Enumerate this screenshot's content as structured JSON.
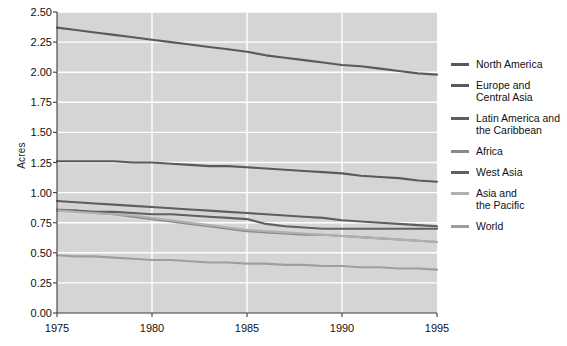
{
  "chart_data": {
    "type": "line",
    "title": "",
    "xlabel": "",
    "ylabel": "Acres",
    "xlim": [
      1975,
      1995
    ],
    "ylim": [
      0.0,
      2.5
    ],
    "grid": true,
    "legend_position": "right",
    "x": [
      1975,
      1976,
      1977,
      1978,
      1979,
      1980,
      1981,
      1982,
      1983,
      1984,
      1985,
      1986,
      1987,
      1988,
      1989,
      1990,
      1991,
      1992,
      1993,
      1994,
      1995
    ],
    "xticks": [
      "1975",
      "1980",
      "1985",
      "1990",
      "1995"
    ],
    "yticks": [
      "0.00",
      "0.25",
      "0.50",
      "0.75",
      "1.00",
      "1.25",
      "1.50",
      "1.75",
      "2.00",
      "2.25",
      "2.50"
    ],
    "series": [
      {
        "name": "North America",
        "color": "#5a5a5a",
        "values": [
          2.37,
          2.35,
          2.33,
          2.31,
          2.29,
          2.27,
          2.25,
          2.23,
          2.21,
          2.19,
          2.17,
          2.14,
          2.12,
          2.1,
          2.08,
          2.06,
          2.05,
          2.03,
          2.01,
          1.99,
          1.98
        ]
      },
      {
        "name": "Europe and\nCentral Asia",
        "color": "#5a5a5a",
        "values": [
          1.26,
          1.26,
          1.26,
          1.26,
          1.25,
          1.25,
          1.24,
          1.23,
          1.22,
          1.22,
          1.21,
          1.2,
          1.19,
          1.18,
          1.17,
          1.16,
          1.14,
          1.13,
          1.12,
          1.1,
          1.09
        ]
      },
      {
        "name": "Latin America and\nthe Caribbean",
        "color": "#5e5e5e",
        "values": [
          0.93,
          0.92,
          0.91,
          0.9,
          0.89,
          0.88,
          0.87,
          0.86,
          0.85,
          0.84,
          0.83,
          0.82,
          0.81,
          0.8,
          0.79,
          0.77,
          0.76,
          0.75,
          0.74,
          0.73,
          0.72
        ]
      },
      {
        "name": "Africa",
        "color": "#8a8a8a",
        "values": [
          0.86,
          0.85,
          0.83,
          0.82,
          0.8,
          0.78,
          0.76,
          0.74,
          0.72,
          0.7,
          0.68,
          0.67,
          0.66,
          0.65,
          0.65,
          0.64,
          0.63,
          0.62,
          0.61,
          0.6,
          0.59
        ]
      },
      {
        "name": "West Asia",
        "color": "#606060",
        "values": [
          0.85,
          0.85,
          0.84,
          0.84,
          0.83,
          0.82,
          0.82,
          0.81,
          0.8,
          0.79,
          0.78,
          0.74,
          0.72,
          0.71,
          0.7,
          0.7,
          0.7,
          0.7,
          0.7,
          0.7,
          0.7
        ]
      },
      {
        "name": "Asia and\nthe Pacific",
        "color": "#b0b0b0",
        "values": [
          0.85,
          0.84,
          0.83,
          0.82,
          0.81,
          0.79,
          0.77,
          0.75,
          0.73,
          0.71,
          0.69,
          0.68,
          0.67,
          0.66,
          0.65,
          0.64,
          0.63,
          0.62,
          0.61,
          0.6,
          0.59
        ]
      },
      {
        "name": "World",
        "color": "#9e9e9e",
        "values": [
          0.48,
          0.47,
          0.47,
          0.46,
          0.45,
          0.44,
          0.44,
          0.43,
          0.42,
          0.42,
          0.41,
          0.41,
          0.4,
          0.4,
          0.39,
          0.39,
          0.38,
          0.38,
          0.37,
          0.37,
          0.36
        ]
      }
    ]
  },
  "legend": {
    "entries": [
      {
        "label": "North America",
        "color": "#5a5a5a"
      },
      {
        "label": "Europe and\nCentral Asia",
        "color": "#5a5a5a"
      },
      {
        "label": "Latin America and\nthe Caribbean",
        "color": "#5e5e5e"
      },
      {
        "label": "Africa",
        "color": "#8a8a8a"
      },
      {
        "label": "West Asia",
        "color": "#606060"
      },
      {
        "label": "Asia and\nthe Pacific",
        "color": "#b0b0b0"
      },
      {
        "label": "World",
        "color": "#9e9e9e"
      }
    ]
  },
  "style": {
    "plot_background": "#d5d5d5",
    "gridline_color": "#ffffff",
    "axis_color": "#3c3c3c",
    "text_color": "#111111"
  }
}
